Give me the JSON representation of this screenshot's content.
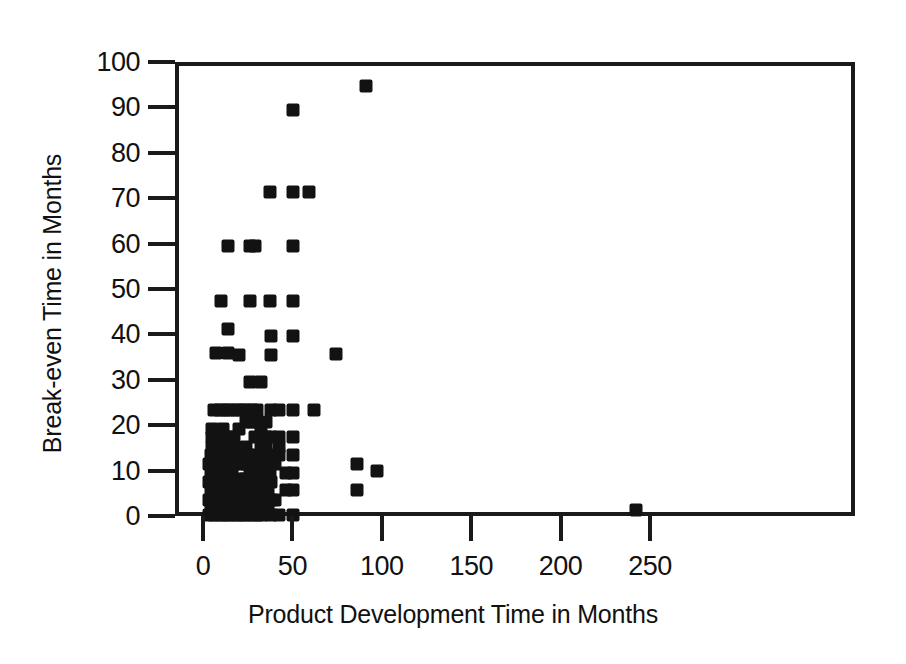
{
  "chart_data": {
    "type": "scatter",
    "title": "",
    "xlabel": "Product Development Time in Months",
    "ylabel": "Break-even Time in Months",
    "xlim": [
      -10,
      266
    ],
    "ylim": [
      -2,
      100
    ],
    "xticks": [
      0,
      50,
      100,
      150,
      200,
      250
    ],
    "xtick_labels": [
      "0",
      "50",
      "100",
      "150",
      "200",
      "250"
    ],
    "yticks": [
      0,
      10,
      20,
      30,
      40,
      50,
      60,
      70,
      80,
      90,
      100
    ],
    "ytick_labels": [
      "0",
      "10",
      "20",
      "30",
      "40",
      "50",
      "60",
      "70",
      "80",
      "90",
      "100"
    ],
    "grid": false,
    "legend": null,
    "marker": {
      "shape": "square",
      "color": "#121212",
      "size_px": 13
    },
    "n_points": 178,
    "points": [
      [
        89,
        95.5
      ],
      [
        48,
        90.2
      ],
      [
        35,
        72.3
      ],
      [
        48,
        72.3
      ],
      [
        57,
        72.3
      ],
      [
        12,
        60.3
      ],
      [
        24,
        60.3
      ],
      [
        27,
        60.3
      ],
      [
        48,
        60.3
      ],
      [
        8,
        48.2
      ],
      [
        24,
        48.2
      ],
      [
        35,
        48.2
      ],
      [
        48,
        48.2
      ],
      [
        12,
        42.0
      ],
      [
        36,
        40.5
      ],
      [
        48,
        40.5
      ],
      [
        12,
        36.8
      ],
      [
        5,
        36.8
      ],
      [
        18,
        36.4
      ],
      [
        36,
        36.4
      ],
      [
        72,
        36.6
      ],
      [
        24,
        30.3
      ],
      [
        30,
        30.3
      ],
      [
        4,
        24.3
      ],
      [
        7,
        24.3
      ],
      [
        10,
        24.3
      ],
      [
        13,
        24.3
      ],
      [
        16,
        24.3
      ],
      [
        19,
        24.3
      ],
      [
        22,
        24.3
      ],
      [
        25,
        24.3
      ],
      [
        28,
        24.3
      ],
      [
        36,
        24.3
      ],
      [
        48,
        24.3
      ],
      [
        60,
        24.3
      ],
      [
        22,
        21.5
      ],
      [
        25,
        21.5
      ],
      [
        28,
        21.5
      ],
      [
        3,
        18.3
      ],
      [
        6,
        18.3
      ],
      [
        9,
        18.3
      ],
      [
        12,
        18.3
      ],
      [
        15,
        18.3
      ],
      [
        27,
        18.3
      ],
      [
        30,
        18.3
      ],
      [
        33,
        18.3
      ],
      [
        36,
        18.3
      ],
      [
        48,
        18.3
      ],
      [
        12,
        16.0
      ],
      [
        15,
        16.0
      ],
      [
        22,
        16.0
      ],
      [
        30,
        16.0
      ],
      [
        33,
        16.0
      ],
      [
        40,
        16.0
      ],
      [
        2,
        14.3
      ],
      [
        5,
        14.3
      ],
      [
        8,
        14.3
      ],
      [
        11,
        14.3
      ],
      [
        14,
        14.3
      ],
      [
        17,
        14.3
      ],
      [
        20,
        14.3
      ],
      [
        23,
        14.3
      ],
      [
        26,
        14.3
      ],
      [
        30,
        14.3
      ],
      [
        33,
        14.3
      ],
      [
        36,
        14.3
      ],
      [
        40,
        14.3
      ],
      [
        48,
        14.3
      ],
      [
        1,
        12.3
      ],
      [
        4,
        12.3
      ],
      [
        7,
        12.3
      ],
      [
        10,
        12.3
      ],
      [
        22,
        12.3
      ],
      [
        26,
        12.3
      ],
      [
        30,
        12.3
      ],
      [
        34,
        12.3
      ],
      [
        84,
        12.3
      ],
      [
        95,
        10.8
      ],
      [
        2,
        10.3
      ],
      [
        5,
        10.3
      ],
      [
        8,
        10.3
      ],
      [
        11,
        10.3
      ],
      [
        14,
        10.3
      ],
      [
        24,
        10.3
      ],
      [
        27,
        10.3
      ],
      [
        31,
        10.3
      ],
      [
        35,
        10.3
      ],
      [
        48,
        10.3
      ],
      [
        1,
        8.4
      ],
      [
        4,
        8.4
      ],
      [
        7,
        8.4
      ],
      [
        10,
        8.4
      ],
      [
        13,
        8.4
      ],
      [
        16,
        8.4
      ],
      [
        19,
        8.4
      ],
      [
        24,
        8.4
      ],
      [
        28,
        8.4
      ],
      [
        32,
        8.4
      ],
      [
        36,
        8.4
      ],
      [
        2,
        6.5
      ],
      [
        5,
        6.5
      ],
      [
        8,
        6.5
      ],
      [
        11,
        6.5
      ],
      [
        14,
        6.5
      ],
      [
        17,
        6.5
      ],
      [
        20,
        6.5
      ],
      [
        23,
        6.5
      ],
      [
        26,
        6.5
      ],
      [
        30,
        6.5
      ],
      [
        34,
        6.5
      ],
      [
        48,
        6.5
      ],
      [
        84,
        6.5
      ],
      [
        1,
        4.5
      ],
      [
        4,
        4.5
      ],
      [
        7,
        4.5
      ],
      [
        10,
        4.5
      ],
      [
        13,
        4.5
      ],
      [
        16,
        4.5
      ],
      [
        19,
        4.5
      ],
      [
        22,
        4.5
      ],
      [
        25,
        4.5
      ],
      [
        28,
        4.5
      ],
      [
        32,
        4.5
      ],
      [
        36,
        4.5
      ],
      [
        2,
        2.5
      ],
      [
        5,
        2.5
      ],
      [
        8,
        2.5
      ],
      [
        11,
        2.5
      ],
      [
        14,
        2.5
      ],
      [
        17,
        2.5
      ],
      [
        20,
        2.5
      ],
      [
        23,
        2.5
      ],
      [
        26,
        2.5
      ],
      [
        30,
        2.5
      ],
      [
        34,
        2.5
      ],
      [
        1,
        1.2
      ],
      [
        4,
        1.2
      ],
      [
        7,
        1.2
      ],
      [
        10,
        1.2
      ],
      [
        13,
        1.2
      ],
      [
        16,
        1.2
      ],
      [
        19,
        1.2
      ],
      [
        22,
        1.2
      ],
      [
        25,
        1.2
      ],
      [
        28,
        1.2
      ],
      [
        31,
        1.2
      ],
      [
        36,
        1.2
      ],
      [
        40,
        1.2
      ],
      [
        48,
        1.2
      ],
      [
        240,
        2.2
      ],
      [
        3,
        20.0
      ],
      [
        9,
        20.0
      ],
      [
        18,
        20.0
      ],
      [
        6,
        9.0
      ],
      [
        12,
        9.0
      ],
      [
        18,
        9.0
      ],
      [
        21,
        9.0
      ],
      [
        3,
        5.5
      ],
      [
        9,
        5.5
      ],
      [
        15,
        5.5
      ],
      [
        21,
        5.5
      ],
      [
        27,
        5.5
      ],
      [
        6,
        3.5
      ],
      [
        12,
        3.5
      ],
      [
        18,
        3.5
      ],
      [
        24,
        3.5
      ],
      [
        31,
        3.5
      ],
      [
        15,
        12.3
      ],
      [
        18,
        12.3
      ],
      [
        38,
        12.3
      ],
      [
        40,
        18.3
      ],
      [
        44,
        10.3
      ],
      [
        44,
        6.5
      ],
      [
        40,
        24.3
      ],
      [
        9,
        13.0
      ],
      [
        6,
        16.0
      ],
      [
        3,
        16.0
      ],
      [
        21,
        14.0
      ],
      [
        27,
        14.0
      ],
      [
        15,
        7.5
      ],
      [
        24,
        7.5
      ],
      [
        33,
        7.5
      ],
      [
        38,
        4.5
      ],
      [
        30,
        20.0
      ],
      [
        33,
        21.5
      ]
    ]
  },
  "axes": {
    "y_title": "Break-even Time in Months",
    "x_title": "Product Development Time in Months"
  }
}
